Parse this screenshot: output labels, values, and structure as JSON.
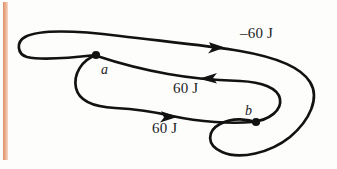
{
  "figure": {
    "type": "closed-path-work-diagram",
    "background_color": "#fdfdfc",
    "stroke_color": "#121212",
    "margin_rule_color": "#e0a07c",
    "energy_labels": [
      {
        "name": "top-segment-work",
        "text": "–60 J",
        "value": -60,
        "unit": "J",
        "direction": "right"
      },
      {
        "name": "middle-segment-work",
        "text": "60 J",
        "value": 60,
        "unit": "J",
        "direction": "left"
      },
      {
        "name": "bottom-segment-work",
        "text": "60 J",
        "value": 60,
        "unit": "J",
        "direction": "right"
      }
    ],
    "points": [
      {
        "name": "point-a",
        "label": "a",
        "x": 97,
        "y": 55
      },
      {
        "name": "point-b",
        "label": "b",
        "x": 256,
        "y": 122
      }
    ]
  }
}
